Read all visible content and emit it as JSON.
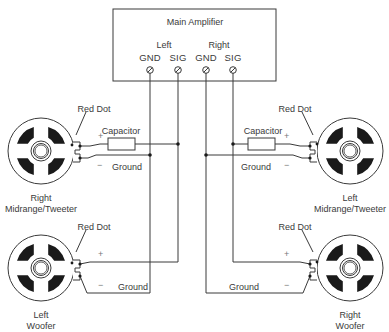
{
  "amplifier": {
    "title": "Main Amplifier",
    "channels": [
      {
        "label": "Left",
        "terminals": [
          "GND",
          "SIG"
        ]
      },
      {
        "label": "Right",
        "terminals": [
          "GND",
          "SIG"
        ]
      }
    ]
  },
  "speakers": [
    {
      "id": "right-midrange-tweeter",
      "name_line1": "Right",
      "name_line2": "Midrange/Tweeter",
      "polarity_label": "Red Dot",
      "has_capacitor": true,
      "capacitor_label": "Capacitor",
      "plus": "+",
      "minus": "−",
      "ground_label": "Ground"
    },
    {
      "id": "left-midrange-tweeter",
      "name_line1": "Left",
      "name_line2": "Midrange/Tweeter",
      "polarity_label": "Red Dot",
      "has_capacitor": true,
      "capacitor_label": "Capacitor",
      "plus": "+",
      "minus": "−",
      "ground_label": "Ground"
    },
    {
      "id": "left-woofer",
      "name_line1": "Left",
      "name_line2": "Woofer",
      "polarity_label": "Red Dot",
      "has_capacitor": false,
      "plus": "+",
      "minus": "−",
      "ground_label": "Ground"
    },
    {
      "id": "right-woofer",
      "name_line1": "Right",
      "name_line2": "Woofer",
      "polarity_label": "Red Dot",
      "has_capacitor": false,
      "plus": "+",
      "minus": "−",
      "ground_label": "Ground"
    }
  ],
  "colors": {
    "line": "#3a3a3a",
    "fill": "#1a1a1a"
  }
}
